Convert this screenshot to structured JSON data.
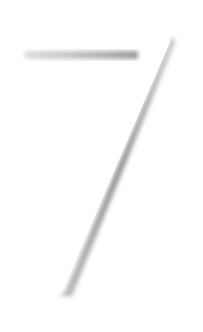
{
  "glyph": {
    "character": "7",
    "fill_color": "#ffffff",
    "shadow_color": "#8a8a8a",
    "background_color": "#ffffff"
  }
}
